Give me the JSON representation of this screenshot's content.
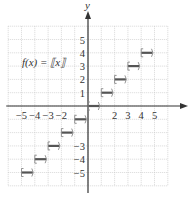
{
  "graph": {
    "title_label": "f(x) = ⟦x⟧",
    "axis_labels": {
      "x": "x",
      "y": "y"
    },
    "x_ticks": [
      "−5",
      "−4",
      "−3",
      "−2",
      "2",
      "3",
      "4",
      "5"
    ],
    "y_ticks": [
      "5",
      "4",
      "3",
      "2",
      "1",
      "−3",
      "−4",
      "−5"
    ],
    "colors": {
      "grid": "#c8c8c8",
      "axis": "#333333",
      "step": "#555555",
      "bracket": "#888888"
    }
  },
  "chart_data": {
    "type": "line",
    "title": "f(x) = ⟦x⟧",
    "xlabel": "x",
    "ylabel": "y",
    "xlim": [
      -6,
      6
    ],
    "ylim": [
      -6,
      6
    ],
    "grid": true,
    "x_tick_labels": [
      "-5",
      "-4",
      "-3",
      "-2",
      "2",
      "3",
      "4",
      "5"
    ],
    "y_tick_labels": [
      "5",
      "4",
      "3",
      "2",
      "1",
      "-3",
      "-4",
      "-5"
    ],
    "series": [
      {
        "name": "greatest integer function",
        "segments": [
          {
            "x_start": -5,
            "x_end": -4,
            "y": -5,
            "closed_left": true,
            "open_right": true
          },
          {
            "x_start": -4,
            "x_end": -3,
            "y": -4,
            "closed_left": true,
            "open_right": true
          },
          {
            "x_start": -3,
            "x_end": -2,
            "y": -3,
            "closed_left": true,
            "open_right": true
          },
          {
            "x_start": -2,
            "x_end": -1,
            "y": -2,
            "closed_left": true,
            "open_right": true
          },
          {
            "x_start": -1,
            "x_end": 0,
            "y": -1,
            "closed_left": true,
            "open_right": true
          },
          {
            "x_start": 0,
            "x_end": 1,
            "y": 0,
            "closed_left": true,
            "open_right": true
          },
          {
            "x_start": 1,
            "x_end": 2,
            "y": 1,
            "closed_left": true,
            "open_right": true
          },
          {
            "x_start": 2,
            "x_end": 3,
            "y": 2,
            "closed_left": true,
            "open_right": true
          },
          {
            "x_start": 3,
            "x_end": 4,
            "y": 3,
            "closed_left": true,
            "open_right": true
          },
          {
            "x_start": 4,
            "x_end": 5,
            "y": 4,
            "closed_left": true,
            "open_right": true
          }
        ]
      }
    ]
  }
}
